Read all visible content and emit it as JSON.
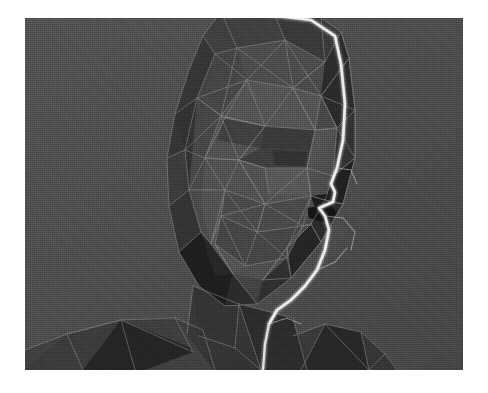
{
  "artwork": {
    "title": "Low-poly wireframe head",
    "subject": "human head, three-quarter profile facing right",
    "medium": "3D polygonal mesh render, halftone / dithered grayscale",
    "alt_text": "A low-polygon 3D wireframe rendering of a human head and shoulders in three-quarter profile facing to the right, rendered in dithered grayscale with a bright white highlight tracing the forehead, nose, lips and chin contour.",
    "border": {
      "style": "white photographic border",
      "color": "#ffffff"
    }
  },
  "canvas": {
    "width": 488,
    "height": 393,
    "plate_x": 25,
    "plate_y": 18,
    "plate_width": 438,
    "plate_height": 352
  },
  "palette": {
    "background": "#4c4c4c",
    "background_dark": "#474747",
    "face_mid": "#4a4a4a",
    "face_light": "#565656",
    "face_shadow": "#3a3a3a",
    "deep_shadow": "#272727",
    "darkest": "#1c1c1c",
    "wire_line": "#9a9a9a",
    "wire_line_soft": "#7d7d7d",
    "highlight_contour": "#ededed",
    "border": "#ffffff"
  },
  "render_settings": {
    "shading": "flat / faceted",
    "wireframe": "visible",
    "wire_opacity": 0.55,
    "contour_highlight": true,
    "dither": "ordered halftone",
    "grain_opacity": 0.55
  },
  "features": [
    {
      "name": "cranium",
      "label": "Cranium / skull dome",
      "tone": "face_mid"
    },
    {
      "name": "forehead",
      "label": "Forehead plane",
      "tone": "face_light"
    },
    {
      "name": "brow-ridge",
      "label": "Brow ridge",
      "tone": "face_shadow"
    },
    {
      "name": "eye-socket",
      "label": "Right eye socket",
      "tone": "face_shadow"
    },
    {
      "name": "cheekbone",
      "label": "Cheekbone",
      "tone": "face_light"
    },
    {
      "name": "nose",
      "label": "Nose bridge and tip",
      "tone": "highlight_contour"
    },
    {
      "name": "nostril",
      "label": "Nostril wedge",
      "tone": "darkest"
    },
    {
      "name": "lips",
      "label": "Lips",
      "tone": "darkest"
    },
    {
      "name": "jawline",
      "label": "Jaw line",
      "tone": "face_shadow"
    },
    {
      "name": "chin",
      "label": "Chin",
      "tone": "face_light"
    },
    {
      "name": "ear-shadow",
      "label": "Ear / temple shadow",
      "tone": "deep_shadow"
    },
    {
      "name": "neck",
      "label": "Neck column",
      "tone": "face_mid"
    },
    {
      "name": "shoulder-left",
      "label": "Left shoulder",
      "tone": "face_shadow"
    },
    {
      "name": "shoulder-right",
      "label": "Right shoulder",
      "tone": "deep_shadow"
    },
    {
      "name": "profile-highlight",
      "label": "Lit profile contour",
      "tone": "highlight_contour"
    }
  ]
}
